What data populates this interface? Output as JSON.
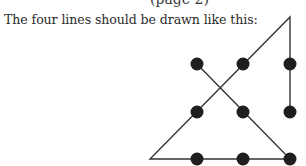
{
  "header": {
    "cut_text": "(page 2)"
  },
  "caption": "The four lines should be drawn like this:",
  "diagram": {
    "line_color": "#333333",
    "dot_color": "#1e1e1e",
    "dots": [
      {
        "x": 197,
        "y": 64
      },
      {
        "x": 243,
        "y": 64
      },
      {
        "x": 290,
        "y": 64
      },
      {
        "x": 197,
        "y": 112
      },
      {
        "x": 243,
        "y": 112
      },
      {
        "x": 290,
        "y": 112
      },
      {
        "x": 197,
        "y": 159
      },
      {
        "x": 243,
        "y": 159
      },
      {
        "x": 290,
        "y": 159
      }
    ],
    "path": [
      {
        "x": 197,
        "y": 64
      },
      {
        "x": 290,
        "y": 159
      },
      {
        "x": 150,
        "y": 159
      },
      {
        "x": 290,
        "y": 17
      },
      {
        "x": 290,
        "y": 112
      }
    ]
  }
}
